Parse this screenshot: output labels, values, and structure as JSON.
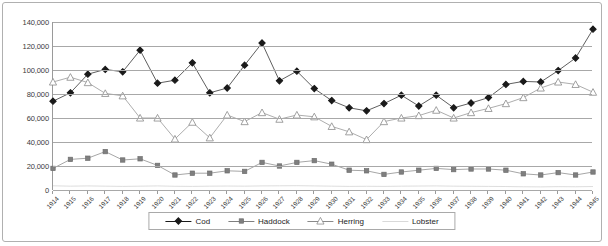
{
  "chart_data": {
    "type": "line",
    "title": "",
    "xlabel": "",
    "ylabel": "",
    "grid": true,
    "legend_position": "bottom-center",
    "ylim": [
      0,
      140000
    ],
    "yticks": [
      0,
      20000,
      40000,
      60000,
      80000,
      100000,
      120000,
      140000
    ],
    "ytick_labels": [
      "0",
      "20,000",
      "40,000",
      "60,000",
      "80,000",
      "100,000",
      "120,000",
      "140,000"
    ],
    "categories": [
      "1914",
      "1915",
      "1916",
      "1917",
      "1918",
      "1919",
      "1920",
      "1921",
      "1922",
      "1923",
      "1924",
      "1925",
      "1926",
      "1927",
      "1928",
      "1929",
      "1930",
      "1931",
      "1932",
      "1933",
      "1934",
      "1935",
      "1936",
      "1937",
      "1938",
      "1939",
      "1940",
      "1941",
      "1942",
      "1943",
      "1944",
      "1945"
    ],
    "series": [
      {
        "name": "Cod",
        "marker": "diamond",
        "color": "#1a1a1a",
        "values": [
          74000,
          81000,
          96500,
          100500,
          98500,
          116500,
          89000,
          91500,
          106000,
          81000,
          85000,
          104000,
          122500,
          91000,
          99000,
          84500,
          74500,
          68500,
          66000,
          72000,
          79000,
          70000,
          79000,
          68500,
          72500,
          77000,
          88000,
          90500,
          90000,
          99500,
          110000,
          134000
        ]
      },
      {
        "name": "Haddock",
        "marker": "square",
        "color": "#7f7f7f",
        "values": [
          18000,
          25500,
          26500,
          32000,
          25000,
          26000,
          20500,
          12500,
          14000,
          14000,
          16000,
          15500,
          23000,
          20000,
          23000,
          24500,
          21500,
          16500,
          16000,
          13000,
          15000,
          16500,
          18000,
          17000,
          17500,
          17500,
          16500,
          13500,
          12500,
          14500,
          12500,
          15000
        ]
      },
      {
        "name": "Herring",
        "marker": "triangle",
        "color": "#8a8a8a",
        "values": [
          90000,
          94000,
          89500,
          80500,
          78500,
          60000,
          60000,
          42500,
          56500,
          43500,
          62500,
          57000,
          64500,
          59000,
          62500,
          61000,
          53000,
          48500,
          42000,
          57000,
          60000,
          62000,
          66500,
          60000,
          64500,
          68000,
          72000,
          77000,
          85000,
          90000,
          88000,
          81500
        ]
      },
      {
        "name": "Lobster",
        "marker": "none",
        "color": "#d9d9d9",
        "values": [
          3500,
          3200,
          3400,
          3200,
          3000,
          3200,
          3400,
          3100,
          3000,
          3200,
          3300,
          3200,
          3400,
          3500,
          3600,
          3400,
          3200,
          3000,
          3100,
          3000,
          3200,
          3300,
          3400,
          3200,
          3100,
          3000,
          2900,
          2700,
          2600,
          2800,
          2700,
          2900
        ]
      }
    ],
    "legend": [
      "Cod",
      "Haddock",
      "Herring",
      "Lobster"
    ]
  },
  "legend": {
    "items": [
      {
        "label": "Cod"
      },
      {
        "label": "Haddock"
      },
      {
        "label": "Herring"
      },
      {
        "label": "Lobster"
      }
    ]
  },
  "colors": {
    "cod": "#1a1a1a",
    "haddock": "#7f7f7f",
    "herring": "#8a8a8a",
    "lobster": "#d9d9d9",
    "grid": "#a8a8a8",
    "border": "#b0b0b0",
    "text": "#3a3a3a"
  }
}
